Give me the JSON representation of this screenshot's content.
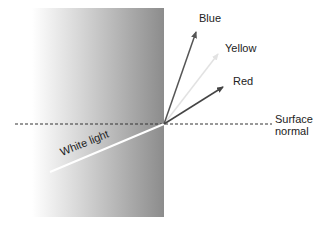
{
  "diagram": {
    "labels": {
      "blue": "Blue",
      "yellow": "Yellow",
      "red": "Red",
      "white_light": "White light",
      "surface_normal_1": "Surface",
      "surface_normal_2": "normal"
    },
    "colors": {
      "blue_ray": "#555555",
      "yellow_ray": "#e0e0e0",
      "red_ray": "#444444",
      "white_ray": "#ffffff",
      "block_dark": "#8a8a8a",
      "block_light": "#ffffff"
    }
  }
}
